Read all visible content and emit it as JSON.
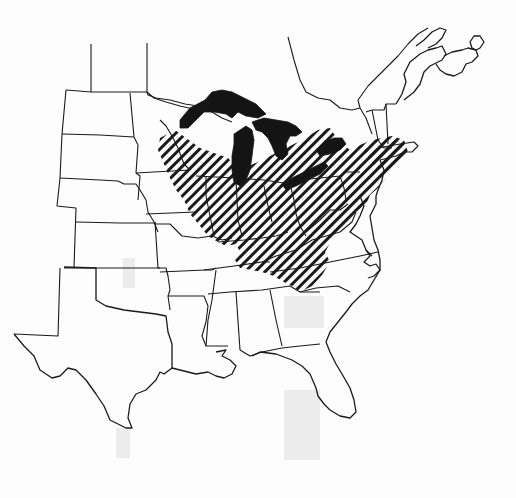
{
  "map": {
    "title": "",
    "region": "Eastern and Central United States",
    "style": "black-and-white line map",
    "colors": {
      "outline": "#1a1a1a",
      "lakes": "#141414",
      "hatch": "#1a1a1a",
      "background": "#fdfdfd"
    },
    "layers": [
      {
        "name": "state-boundaries",
        "symbol": "thin black lines"
      },
      {
        "name": "great-lakes",
        "symbol": "solid black fill"
      },
      {
        "name": "distribution-range",
        "symbol": "diagonal hatching"
      }
    ],
    "labels": []
  }
}
